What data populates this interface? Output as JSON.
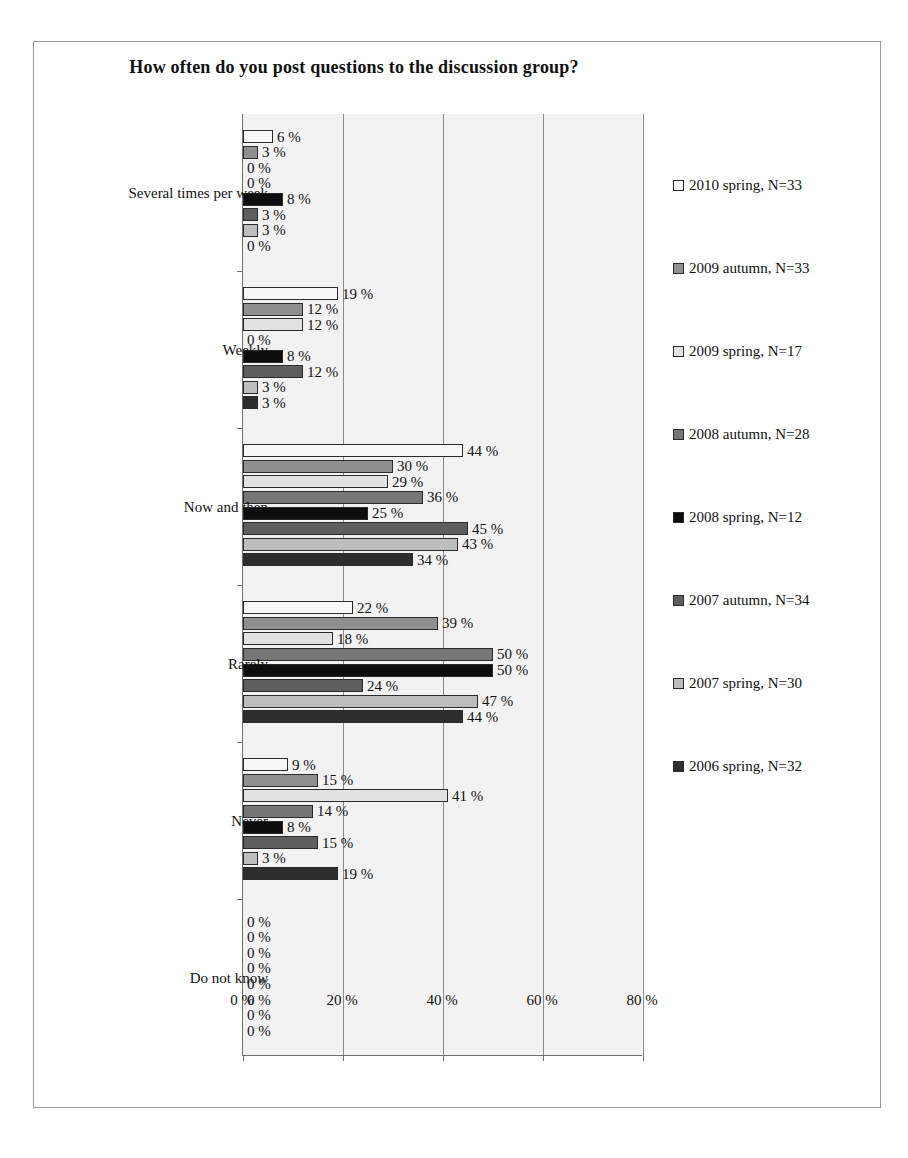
{
  "chart_data": {
    "type": "bar",
    "orientation": "horizontal",
    "title": "How often do you post questions to the discussion group?",
    "xlabel": "",
    "ylabel": "",
    "xlim": [
      0,
      80
    ],
    "xticks": [
      "0 %",
      "20 %",
      "40 %",
      "60 %",
      "80 %"
    ],
    "xtick_values": [
      0,
      20,
      40,
      60,
      80
    ],
    "grid": true,
    "legend_position": "right",
    "value_suffix": " %",
    "categories": [
      "Several times per week",
      "Weekly",
      "Now and then",
      "Rarely",
      "Never",
      "Do not know"
    ],
    "series": [
      {
        "name": "2010 spring, N=33",
        "color": "#f7f7f7",
        "values": [
          6,
          19,
          44,
          22,
          9,
          0
        ]
      },
      {
        "name": "2009 autumn, N=33",
        "color": "#8f8f8f",
        "values": [
          3,
          12,
          30,
          39,
          15,
          0
        ]
      },
      {
        "name": "2009 spring, N=17",
        "color": "#e2e2e2",
        "values": [
          0,
          12,
          29,
          18,
          41,
          0
        ]
      },
      {
        "name": "2008 autumn, N=28",
        "color": "#767676",
        "values": [
          0,
          0,
          36,
          50,
          14,
          0
        ]
      },
      {
        "name": "2008 spring, N=12",
        "color": "#0d0d0d",
        "values": [
          8,
          8,
          25,
          50,
          8,
          0
        ]
      },
      {
        "name": "2007 autumn, N=34",
        "color": "#5e5e5e",
        "values": [
          3,
          12,
          45,
          24,
          15,
          0
        ]
      },
      {
        "name": "2007 spring, N=30",
        "color": "#bdbdbd",
        "values": [
          3,
          3,
          43,
          47,
          3,
          0
        ]
      },
      {
        "name": "2006 spring, N=32",
        "color": "#2e2e2e",
        "values": [
          0,
          3,
          34,
          44,
          19,
          0
        ]
      }
    ],
    "labels": [
      [
        "6 %",
        "3 %",
        "0 %",
        "0 %",
        "8 %",
        "3 %",
        "3 %",
        "0 %"
      ],
      [
        "19 %",
        "12 %",
        "12 %",
        "0 %",
        "8 %",
        "12 %",
        "3 %",
        "3 %"
      ],
      [
        "44 %",
        "30 %",
        "29 %",
        "36 %",
        "25 %",
        "45 %",
        "43 %",
        "34 %"
      ],
      [
        "22 %",
        "39 %",
        "18 %",
        "50 %",
        "50 %",
        "24 %",
        "47 %",
        "44 %"
      ],
      [
        "9 %",
        "15 %",
        "41 %",
        "14 %",
        "8 %",
        "15 %",
        "3 %",
        "19 %"
      ],
      [
        "0 %",
        "0 %",
        "0 %",
        "0 %",
        "0 %",
        "0 %",
        "0 %",
        "0 %"
      ]
    ]
  }
}
